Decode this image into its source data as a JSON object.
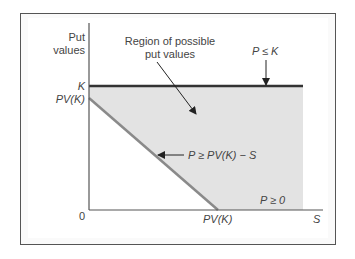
{
  "diagram": {
    "y_axis_label_line1": "Put",
    "y_axis_label_line2": "values",
    "x_axis_label": "S",
    "origin_label": "0",
    "y_tick_k": "K",
    "y_tick_pvk": "PV(K)",
    "x_tick_pvk": "PV(K)",
    "region_label_line1": "Region of possible",
    "region_label_line2": "put values",
    "upper_bound_label": "P ≤ K",
    "lower_bound_label": "P ≥ PV(K) − S",
    "nonneg_label": "P ≥ 0",
    "colors": {
      "region_fill": "#e3e3e3",
      "k_line": "#333333",
      "diagonal": "#8a8a8a",
      "axes": "#555555",
      "frame": "#555555"
    }
  }
}
